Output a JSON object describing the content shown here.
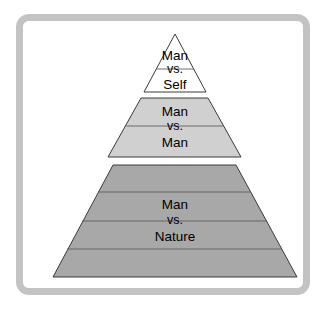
{
  "diagram": {
    "frame": {
      "border_color": "#c3c3c3",
      "background_color": "#ffffff"
    },
    "tiers": [
      {
        "id": "tier-self",
        "position": "top",
        "fill_color": "#ffffff",
        "outline_color": "#3a3a3a",
        "divider_count": 1,
        "lines": [
          "Man",
          "vs.",
          "Self"
        ],
        "line1": "Man",
        "line2": "vs.",
        "line3": "Self"
      },
      {
        "id": "tier-man",
        "position": "middle",
        "fill_color": "#d0d0d0",
        "outline_color": "#3a3a3a",
        "divider_count": 1,
        "lines": [
          "Man",
          "vs.",
          "Man"
        ],
        "line1": "Man",
        "line2": "vs.",
        "line3": "Man"
      },
      {
        "id": "tier-nature",
        "position": "bottom",
        "fill_color": "#a8a8a8",
        "outline_color": "#3a3a3a",
        "divider_count": 3,
        "lines": [
          "Man",
          "vs.",
          "Nature"
        ],
        "line1": "Man",
        "line2": "vs.",
        "line3": "Nature"
      }
    ]
  }
}
